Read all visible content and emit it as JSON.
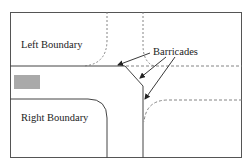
{
  "diagram": {
    "type": "road-intersection",
    "labels": {
      "left_boundary": "Left Boundary",
      "right_boundary": "Right Boundary",
      "barricades": "Barricades"
    },
    "colors": {
      "line": "#444444",
      "dashed": "#777777",
      "vehicle": "#a9a9a9",
      "frame": "#555555",
      "background": "#ffffff"
    }
  }
}
